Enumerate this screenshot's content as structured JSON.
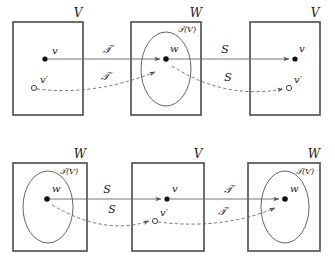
{
  "figure": {
    "title": "",
    "rows": [
      {
        "id": "top-row",
        "panels": [
          {
            "id": "top-left",
            "set_label": "V",
            "has_ellipse": false,
            "ellipse_label": "",
            "points": [
              {
                "name": "v",
                "label": "v",
                "style": "filled"
              },
              {
                "name": "v-prime",
                "label": "v′",
                "style": "hollow"
              }
            ]
          },
          {
            "id": "top-middle",
            "set_label": "W",
            "has_ellipse": true,
            "ellipse_label": "𝒯(V)",
            "points": [
              {
                "name": "w",
                "label": "w",
                "style": "filled"
              }
            ]
          },
          {
            "id": "top-right",
            "set_label": "V",
            "has_ellipse": false,
            "ellipse_label": "",
            "points": [
              {
                "name": "v",
                "label": "v",
                "style": "filled"
              },
              {
                "name": "v-prime",
                "label": "v′",
                "style": "hollow"
              }
            ]
          }
        ],
        "arrows": [
          {
            "id": "top-solid-left",
            "label": "𝒯",
            "style": "solid"
          },
          {
            "id": "top-dashed-left",
            "label": "𝒯",
            "style": "dashed"
          },
          {
            "id": "top-solid-right",
            "label": "S",
            "style": "solid"
          },
          {
            "id": "top-dashed-right",
            "label": "S",
            "style": "dashed"
          }
        ]
      },
      {
        "id": "bottom-row",
        "panels": [
          {
            "id": "bottom-left",
            "set_label": "W",
            "has_ellipse": true,
            "ellipse_label": "𝒯(V)",
            "points": [
              {
                "name": "w",
                "label": "w",
                "style": "filled"
              }
            ]
          },
          {
            "id": "bottom-middle",
            "set_label": "V",
            "has_ellipse": false,
            "ellipse_label": "",
            "points": [
              {
                "name": "v",
                "label": "v",
                "style": "filled"
              },
              {
                "name": "v-prime",
                "label": "v′",
                "style": "hollow"
              }
            ]
          },
          {
            "id": "bottom-right",
            "set_label": "W",
            "has_ellipse": true,
            "ellipse_label": "𝒯(V)",
            "points": [
              {
                "name": "w",
                "label": "w",
                "style": "filled"
              }
            ]
          }
        ],
        "arrows": [
          {
            "id": "bottom-solid-left",
            "label": "S",
            "style": "solid"
          },
          {
            "id": "bottom-dashed-left",
            "label": "S",
            "style": "dashed"
          },
          {
            "id": "bottom-solid-right",
            "label": "𝒯",
            "style": "solid"
          },
          {
            "id": "bottom-dashed-right",
            "label": "𝒯",
            "style": "dashed"
          }
        ]
      }
    ],
    "colors": {
      "box_stroke": "#4a4a4a",
      "ellipse_stroke": "#555555",
      "arrow_stroke": "#666666",
      "point_fill": "#111111",
      "text": "#1a1a1a",
      "background": "#ffffff"
    }
  }
}
